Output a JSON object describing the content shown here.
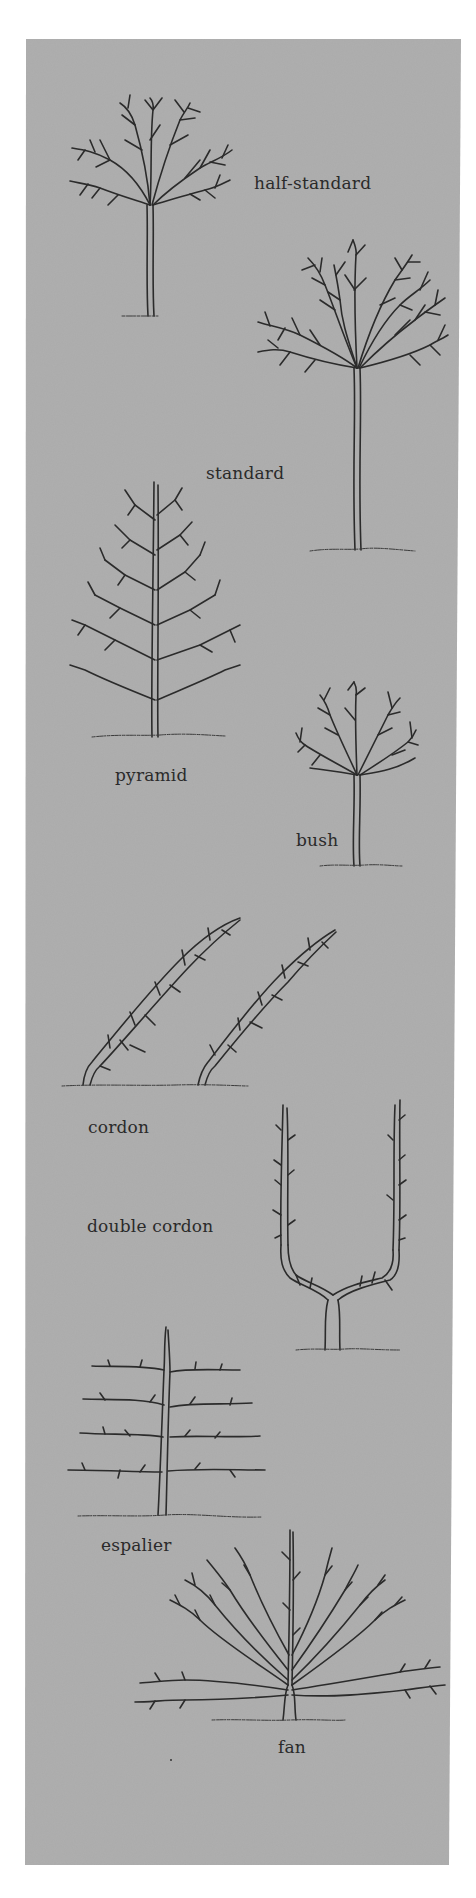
{
  "illustration": {
    "title": "Fruit tree training forms",
    "colors": {
      "page_background": "#ffffff",
      "panel_background": "#ababab",
      "ink": "#2b2b2b"
    },
    "forms": [
      {
        "id": "half-standard",
        "label": "half-standard",
        "shape": "round-crown-medium-stem"
      },
      {
        "id": "standard",
        "label": "standard",
        "shape": "round-crown-tall-stem"
      },
      {
        "id": "pyramid",
        "label": "pyramid",
        "shape": "conical-crown"
      },
      {
        "id": "bush",
        "label": "bush",
        "shape": "round-crown-short-stem"
      },
      {
        "id": "cordon",
        "label": "cordon",
        "shape": "two-oblique-single-stems"
      },
      {
        "id": "double-cordon",
        "label": "double cordon",
        "shape": "u-shaped-twin-stems"
      },
      {
        "id": "espalier",
        "label": "espalier",
        "shape": "horizontal-tiers"
      },
      {
        "id": "fan",
        "label": "fan",
        "shape": "radiating-ribs"
      }
    ]
  }
}
